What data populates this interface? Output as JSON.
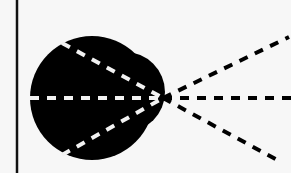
{
  "diagram": {
    "type": "geometric-ray-diagram",
    "background_color": "#f7f7f7",
    "ink_color": "#000000",
    "dash_inside_color": "#f2f2f2",
    "boundary_line": {
      "x": 17,
      "y1": 0,
      "y2": 173
    },
    "blob": {
      "main_circle": {
        "cx": 92,
        "cy": 98,
        "r": 62
      },
      "side_lobe": {
        "cx": 125,
        "cy": 92,
        "r": 40
      }
    },
    "focal_point": {
      "x": 163,
      "y": 98
    },
    "rays": [
      {
        "name": "upper-ray",
        "inner_start": {
          "x": 62,
          "y": 43
        },
        "end": {
          "x": 289,
          "y": 37
        }
      },
      {
        "name": "horizontal-ray",
        "inner_start": {
          "x": 30,
          "y": 98
        },
        "end": {
          "x": 291,
          "y": 98
        }
      },
      {
        "name": "lower-ray",
        "inner_start": {
          "x": 62,
          "y": 155
        },
        "end": {
          "x": 279,
          "y": 161
        }
      }
    ]
  }
}
